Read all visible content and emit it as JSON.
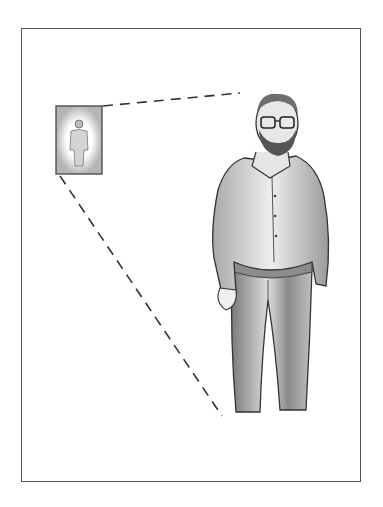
{
  "image": {
    "description": "Pencil sketch of a bearded man with glasses standing, hands in pockets, with a small framed thumbnail of the same figure connected by dashed perspective lines",
    "subject": "standing man",
    "features": [
      "beard",
      "glasses",
      "collared shirt",
      "trousers"
    ],
    "colors": {
      "background": "#ffffff",
      "frame": "#555555",
      "pencil_dark": "#333333",
      "pencil_mid": "#888888",
      "pencil_light": "#c8c8c8"
    }
  }
}
